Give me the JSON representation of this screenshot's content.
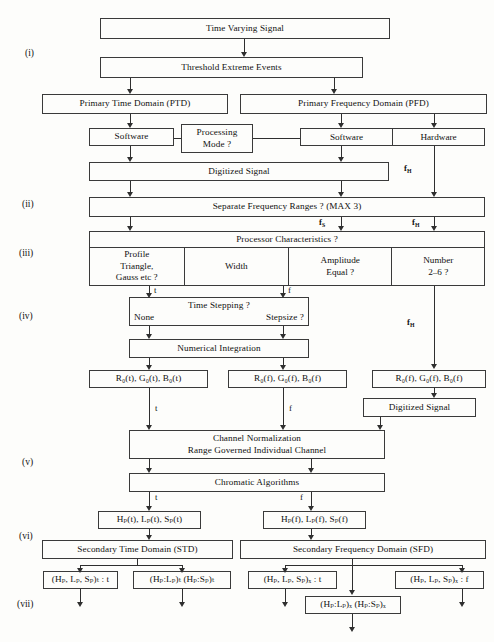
{
  "diagram": {
    "stages": [
      "(i)",
      "(ii)",
      "(iii)",
      "(iv)",
      "(v)",
      "(vi)",
      "(vii)"
    ]
  },
  "stage_labels": {
    "i": "(i)",
    "ii": "(ii)",
    "iii": "(iii)",
    "iv": "(iv)",
    "v": "(v)",
    "vi": "(vi)",
    "vii": "(vii)"
  },
  "nodes": {
    "time_varying_signal": "Time Varying Signal",
    "threshold_extreme_events": "Threshold Extreme Events",
    "primary_time_domain": "Primary Time Domain (PTD)",
    "primary_frequency_domain": "Primary Frequency Domain (PFD)",
    "software_left": "Software",
    "processing_mode_line1": "Processing",
    "processing_mode_line2": "Mode ?",
    "software_right": "Software",
    "hardware_right": "Hardware",
    "digitized_signal_top": "Digitized Signal",
    "separate_frequency_ranges": "Separate Frequency Ranges ? (MAX 3)",
    "processor_characteristics": "Processor Characteristics ?",
    "proc_profile_line1": "Profile",
    "proc_profile_line2": "Triangle,",
    "proc_profile_line3": "Gauss etc ?",
    "proc_width": "Width",
    "proc_amplitude_line1": "Amplitude",
    "proc_amplitude_line2": "Equal ?",
    "proc_number_line1": "Number",
    "proc_number_line2": "2–6  ?",
    "time_stepping_title": "Time Stepping ?",
    "time_stepping_none": "None",
    "time_stepping_stepsize": "Stepsize ?",
    "numerical_integration": "Numerical Integration",
    "rgb_time": "R₀(t),  G₀(t),  B₀(t)",
    "rgb_freq_mid": "R₀(f),  G₀(f),  B₀(f)",
    "rgb_freq_right": "R₀(f),  G₀(f),  B₀(f)",
    "digitized_signal_right": "Digitized Signal",
    "channel_norm_line1": "Channel   Normalization",
    "channel_norm_line2": "Range Governed     Individual Channel",
    "chromatic_algorithms": "Chromatic Algorithms",
    "hls_time": "Hₚ(t),  Lₚ(t),  Sₚ(t)",
    "hls_freq": "Hₚ(f),  Lₚ(f),  Sₚ(f)",
    "secondary_time_domain": "Secondary Time Domain (STD)",
    "secondary_frequency_domain": "Secondary Frequency Domain (SFD)",
    "std_triplet_t": "(Hₚ, Lₚ, Sₚ)ₜ : t",
    "std_pairs_t": "(Hₚ:Lₚ)ₜ  (Hₚ:Sₚ)ₜ",
    "sfd_triplet_t": "(Hₚ, Lₚ, Sₚ)ₓ : t",
    "sfd_triplet_f": "(Hₚ, Lₚ, Sₚ)ₓ : f",
    "sfd_pairs_f": "(Hₚ:Lₚ)ₓ  (Hₚ:Sₚ)ₓ"
  },
  "edge_labels": {
    "fh_top": "f",
    "fh_top_sub": "H",
    "fs_mid": "f",
    "fs_mid_sub": "S",
    "fh_mid": "f",
    "fh_mid_sub": "H",
    "fh_lower": "f",
    "fh_lower_sub": "H",
    "t_proc": "t",
    "f_proc": "f",
    "t_rgb": "t",
    "f_rgb": "f",
    "t_chroma": "t",
    "f_chroma": "f"
  },
  "colors": {
    "line": "#2f2f2f",
    "border": "#3a3a3a",
    "background": "#fdfdfb",
    "text": "#111111"
  }
}
